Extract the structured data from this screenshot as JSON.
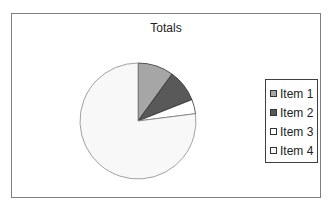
{
  "chart_data": {
    "type": "pie",
    "title": "Totals",
    "categories": [
      "Item 1",
      "Item 2",
      "Item 3",
      "Item 4"
    ],
    "values": [
      10,
      9,
      4,
      77
    ],
    "colors": [
      "#a6a6a6",
      "#595959",
      "#ffffff",
      "#f8f8f8"
    ],
    "legend_position": "right",
    "start_angle_deg": 0,
    "direction": "clockwise"
  },
  "legend": {
    "items": [
      {
        "label": "Item 1",
        "color": "#a6a6a6"
      },
      {
        "label": "Item 2",
        "color": "#595959"
      },
      {
        "label": "Item 3",
        "color": "#ffffff"
      },
      {
        "label": "Item 4",
        "color": "#f8f8f8"
      }
    ]
  }
}
